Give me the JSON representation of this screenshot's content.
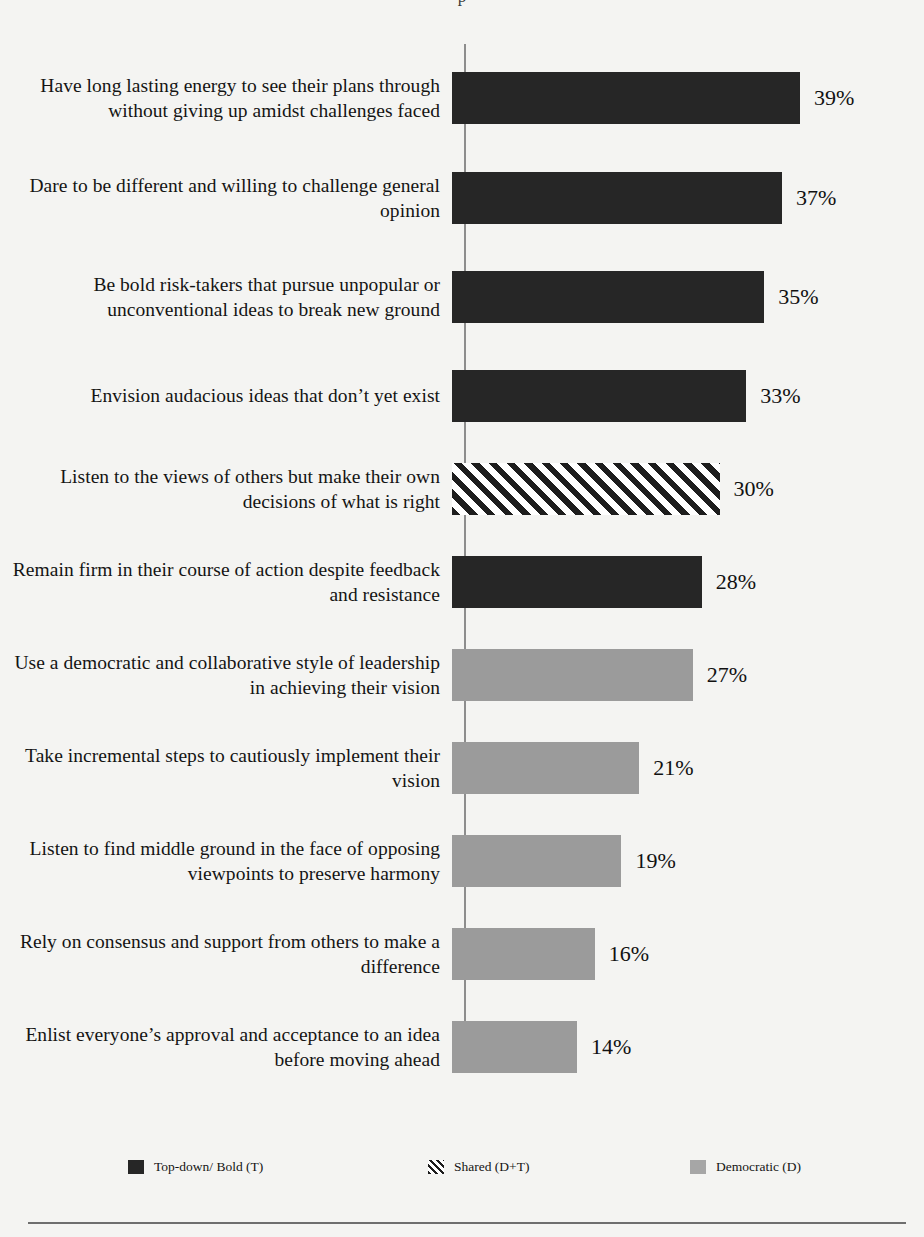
{
  "chart_data": {
    "type": "bar",
    "orientation": "horizontal",
    "title": "",
    "xlabel": "",
    "ylabel": "",
    "xlim": [
      0,
      42
    ],
    "grid": false,
    "value_suffix": "%",
    "legend_position": "bottom",
    "categories": [
      "Have long lasting energy to see their plans through without giving up amidst challenges faced",
      "Dare to be different and willing to challenge  general opinion",
      "Be bold risk-takers  that pursue unpopular or unconventional ideas to break new ground",
      "Envision audacious ideas that don’t  yet exist",
      "Listen to the views of others but make their own decisions of what is right",
      "Remain firm in their course of action despite feedback and resistance",
      "Use a democratic and collaborative style of leadership  in achieving their vision",
      "Take incremental steps to cautiously implement their vision",
      "Listen to find middle ground in the face of opposing viewpoints  to preserve harmony",
      "Rely on consensus and support from others to make a difference",
      "Enlist everyone’s approval and acceptance to an idea before moving ahead"
    ],
    "values": [
      39,
      37,
      35,
      33,
      30,
      28,
      27,
      21,
      19,
      16,
      14
    ],
    "value_labels": [
      "39%",
      "37%",
      "35%",
      "33%",
      "30%",
      "28%",
      "27%",
      "21%",
      "19%",
      "16%",
      "14%"
    ],
    "series_of_point": [
      "top-down",
      "top-down",
      "top-down",
      "top-down",
      "shared",
      "top-down",
      "democratic",
      "democratic",
      "democratic",
      "democratic",
      "democratic"
    ],
    "legend": [
      {
        "key": "top-down",
        "label": "Top-down/ Bold (T)",
        "fill": "solid-dark",
        "color": "#262626"
      },
      {
        "key": "shared",
        "label": "Shared (D+T)",
        "fill": "hatch",
        "color": "#1d1d1d"
      },
      {
        "key": "democratic",
        "label": "Democratic (D)",
        "fill": "solid-gray",
        "color": "#9b9b9b"
      }
    ]
  },
  "bars": [
    {
      "label": "Have long lasting energy to see their plans through without giving up amidst challenges faced",
      "value": 39,
      "value_label": "39%",
      "fill": "solid-dark",
      "row_height": 107
    },
    {
      "label": "Dare to be different and willing to challenge  general opinion",
      "value": 37,
      "value_label": "37%",
      "fill": "solid-dark",
      "row_height": 93
    },
    {
      "label": "Be bold risk-takers  that pursue unpopular or unconventional ideas to break new ground",
      "value": 35,
      "value_label": "35%",
      "fill": "solid-dark",
      "row_height": 105
    },
    {
      "label": "Envision audacious ideas that don’t  yet exist",
      "value": 33,
      "value_label": "33%",
      "fill": "solid-dark",
      "row_height": 93
    },
    {
      "label": "Listen to the views of others but make their own decisions of what is right",
      "value": 30,
      "value_label": "30%",
      "fill": "hatch",
      "row_height": 93
    },
    {
      "label": "Remain firm in their course of action despite feedback and resistance",
      "value": 28,
      "value_label": "28%",
      "fill": "solid-dark",
      "row_height": 93
    },
    {
      "label": "Use a democratic and collaborative style of leadership  in achieving their vision",
      "value": 27,
      "value_label": "27%",
      "fill": "solid-gray",
      "row_height": 93
    },
    {
      "label": "Take incremental steps to cautiously implement their vision",
      "value": 21,
      "value_label": "21%",
      "fill": "solid-gray",
      "row_height": 93
    },
    {
      "label": "Listen to find middle ground in the face of opposing viewpoints  to preserve harmony",
      "value": 19,
      "value_label": "19%",
      "fill": "solid-gray",
      "row_height": 93
    },
    {
      "label": "Rely on consensus and support from others to make a difference",
      "value": 16,
      "value_label": "16%",
      "fill": "solid-gray",
      "row_height": 93
    },
    {
      "label": "Enlist everyone’s approval and acceptance to an idea before moving ahead",
      "value": 14,
      "value_label": "14%",
      "fill": "solid-gray",
      "row_height": 93
    }
  ],
  "scale": {
    "px_per_unit": 8.92
  },
  "colors": {
    "dark": "#262626",
    "gray": "#9b9b9b",
    "hatch_line": "#1d1d1d",
    "axis": "#8d8d8d",
    "rule": "#6e6e6e",
    "paper": "#f4f4f2",
    "text": "#141414"
  },
  "title_sliver": "p"
}
